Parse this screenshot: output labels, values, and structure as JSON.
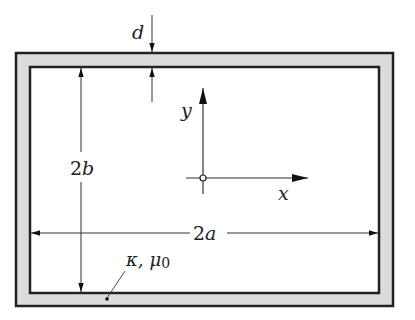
{
  "figure": {
    "type": "cross-section diagram"
  },
  "labels": {
    "thickness": "d",
    "height": "2b",
    "height_num": "2",
    "height_var": "b",
    "width": "2a",
    "width_num": "2",
    "width_var": "a",
    "y_axis": "y",
    "x_axis": "x",
    "material": "κ, μ",
    "material_kappa": "κ,",
    "material_mu": "μ",
    "material_mu_sub": "0"
  },
  "colors": {
    "wall_fill": "#dcdcdc",
    "stroke": "#222222",
    "background": "#ffffff"
  }
}
